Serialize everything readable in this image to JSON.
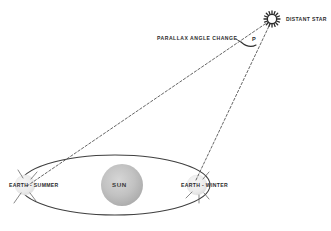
{
  "diagram": {
    "background_color": "#ffffff",
    "line_color": "#3a3a3a",
    "sun_color": "#b9b9b9",
    "earth_color": "#ededed",
    "labels": {
      "distant_star": "DISTANT STAR",
      "parallax_angle_change": "PARALLAX  ANGLE  CHANGE",
      "angle_symbol": "P",
      "earth_summer": "EARTH - SUMMER",
      "earth_winter": "EARTH - WINTER",
      "sun": "SUN"
    },
    "objects": {
      "star": {
        "name": "distant-star",
        "x": 272,
        "y": 19,
        "radius": 7
      },
      "sun": {
        "name": "sun",
        "x": 122,
        "y": 185,
        "radius": 21
      },
      "earth_summer": {
        "name": "earth-summer",
        "x": 25,
        "y": 185,
        "radius": 10
      },
      "earth_winter": {
        "name": "earth-winter",
        "x": 197,
        "y": 185,
        "radius": 10
      },
      "orbit": {
        "name": "earth-orbit",
        "cx": 115,
        "cy": 185,
        "rx": 95,
        "ry": 30
      }
    },
    "sight_lines": [
      {
        "name": "sightline-summer-to-star",
        "from": "earth-summer",
        "to": "distant-star",
        "style": "dashed"
      },
      {
        "name": "sightline-winter-to-star",
        "from": "earth-winter",
        "to": "distant-star",
        "style": "dashed"
      }
    ]
  }
}
